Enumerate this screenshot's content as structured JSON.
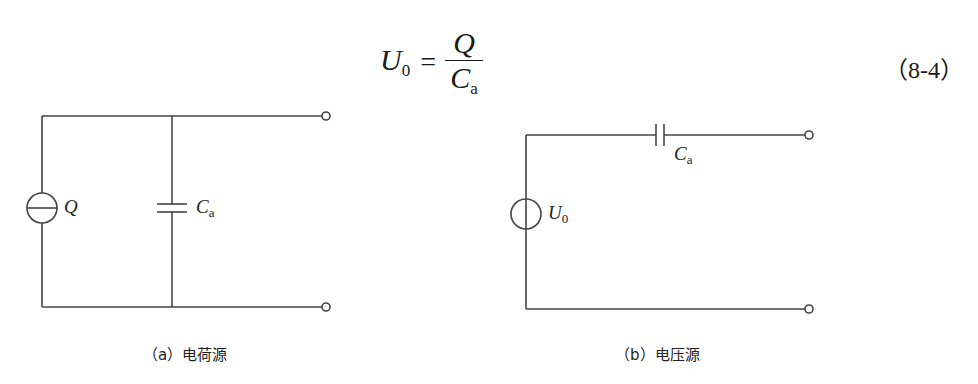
{
  "formula": {
    "lhs_symbol": "U",
    "lhs_subscript": "0",
    "equals": "=",
    "numerator": "Q",
    "denominator_symbol": "C",
    "denominator_subscript": "a",
    "equation_number": "（8-4）"
  },
  "circuit_a": {
    "source_label": "Q",
    "capacitor_label_symbol": "C",
    "capacitor_label_subscript": "a",
    "caption": "（a）电荷源",
    "source_type": "charge-source"
  },
  "circuit_b": {
    "source_label_symbol": "U",
    "source_label_subscript": "0",
    "capacitor_label_symbol": "C",
    "capacitor_label_subscript": "a",
    "caption": "（b）电压源",
    "source_type": "voltage-source"
  },
  "colors": {
    "line": "#444444",
    "text": "#222222",
    "background": "#ffffff"
  }
}
